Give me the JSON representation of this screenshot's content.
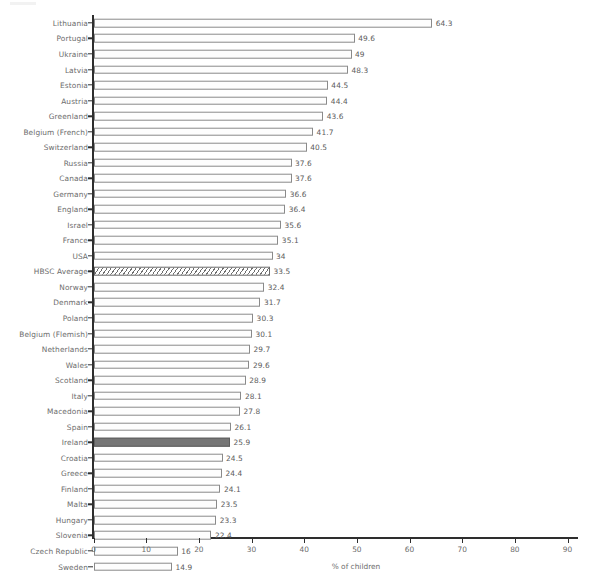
{
  "chart_data": {
    "type": "bar",
    "orientation": "horizontal",
    "title": "",
    "subtitle": "",
    "xlabel": "% of children",
    "ylabel": "",
    "xlim": [
      0,
      90
    ],
    "xticks": [
      0,
      10,
      20,
      30,
      40,
      50,
      60,
      70,
      80,
      90
    ],
    "xtick_labels": [
      "0",
      "10",
      "20",
      "30",
      "40",
      "50",
      "60",
      "70",
      "80",
      "90"
    ],
    "grid": false,
    "legend": "none",
    "value_labels_shown": true,
    "colors": {
      "bar_fill": "#fdfdfd",
      "bar_border": "#8a8a8a",
      "highlight_fill": "#767676",
      "hatched_fill": "#fdfdfd",
      "axis": "#2e2e2e",
      "text": "#6c6c6c"
    },
    "categories": [
      "Lithuania",
      "Portugal",
      "Ukraine",
      "Latvia",
      "Estonia",
      "Austria",
      "Greenland",
      "Belgium (French)",
      "Switzerland",
      "Russia",
      "Canada",
      "Germany",
      "England",
      "Israel",
      "France",
      "USA",
      "HBSC Average",
      "Norway",
      "Denmark",
      "Poland",
      "Belgium (Flemish)",
      "Netherlands",
      "Wales",
      "Scotland",
      "Italy",
      "Macedonia",
      "Spain",
      "Ireland",
      "Croatia",
      "Greece",
      "Finland",
      "Malta",
      "Hungary",
      "Slovenia",
      "Czech Republic",
      "Sweden"
    ],
    "values": [
      64.3,
      49.6,
      49,
      48.3,
      44.5,
      44.4,
      43.6,
      41.7,
      40.5,
      37.6,
      37.6,
      36.6,
      36.4,
      35.6,
      35.1,
      34,
      33.5,
      32.4,
      31.7,
      30.3,
      30.1,
      29.7,
      29.6,
      28.9,
      28.1,
      27.8,
      26.1,
      25.9,
      24.5,
      24.4,
      24.1,
      23.5,
      23.3,
      22.4,
      16,
      14.9
    ],
    "value_labels": [
      "64.3",
      "49.6",
      "49",
      "48.3",
      "44.5",
      "44.4",
      "43.6",
      "41.7",
      "40.5",
      "37.6",
      "37.6",
      "36.6",
      "36.4",
      "35.6",
      "35.1",
      "34",
      "33.5",
      "32.4",
      "31.7",
      "30.3",
      "30.1",
      "29.7",
      "29.6",
      "28.9",
      "28.1",
      "27.8",
      "26.1",
      "25.9",
      "24.5",
      "24.4",
      "24.1",
      "23.5",
      "23.3",
      "22.4",
      "16",
      "14.9"
    ],
    "bar_styles": [
      "outline",
      "outline",
      "outline",
      "outline",
      "outline",
      "outline",
      "outline",
      "outline",
      "outline",
      "outline",
      "outline",
      "outline",
      "outline",
      "outline",
      "outline",
      "outline",
      "hatched",
      "outline",
      "outline",
      "outline",
      "outline",
      "outline",
      "outline",
      "outline",
      "outline",
      "outline",
      "outline",
      "highlight",
      "outline",
      "outline",
      "outline",
      "outline",
      "outline",
      "outline",
      "outline",
      "outline"
    ]
  }
}
